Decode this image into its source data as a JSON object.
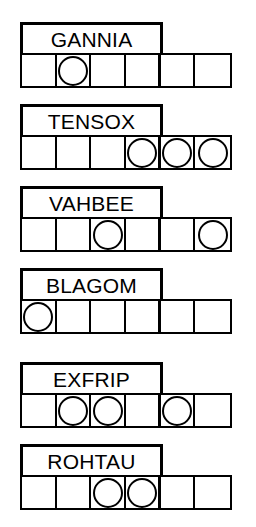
{
  "puzzle": {
    "cells_per_row": 6,
    "label_span_cells": 4,
    "ink_color": "#000000",
    "paper_color": "#ffffff",
    "token_shape": "circle",
    "rows": [
      {
        "label": "GANNIA",
        "filled_cells": [
          2
        ],
        "cells": [
          "",
          "circle",
          "",
          "",
          "",
          ""
        ]
      },
      {
        "label": "TENSOX",
        "filled_cells": [
          4,
          5,
          6
        ],
        "cells": [
          "",
          "",
          "",
          "circle",
          "circle",
          "circle"
        ]
      },
      {
        "label": "VAHBEE",
        "filled_cells": [
          3,
          6
        ],
        "cells": [
          "",
          "",
          "circle",
          "",
          "",
          "circle"
        ]
      },
      {
        "label": "BLAGOM",
        "filled_cells": [
          1
        ],
        "cells": [
          "circle",
          "",
          "",
          "",
          "",
          ""
        ]
      },
      {
        "label": "EXFRIP",
        "filled_cells": [
          2,
          3,
          5
        ],
        "cells": [
          "",
          "circle",
          "circle",
          "",
          "circle",
          ""
        ]
      },
      {
        "label": "ROHTAU",
        "filled_cells": [
          3,
          4
        ],
        "cells": [
          "",
          "",
          "circle",
          "circle",
          "",
          ""
        ]
      }
    ]
  }
}
